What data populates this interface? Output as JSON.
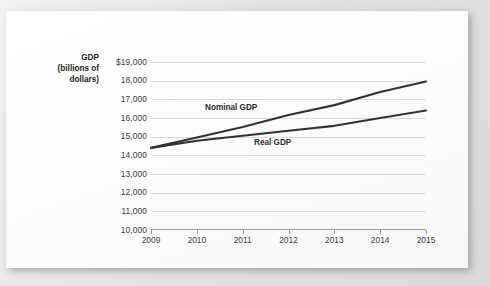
{
  "chart_data": {
    "type": "line",
    "title": "",
    "xlabel": "",
    "ylabel": "GDP (billions of dollars)",
    "ylabel_line1": "GDP",
    "ylabel_line2": "(billions of",
    "ylabel_line3": "dollars)",
    "x": [
      2009,
      2010,
      2011,
      2012,
      2013,
      2014,
      2015
    ],
    "categories": [
      "2009",
      "2010",
      "2011",
      "2012",
      "2013",
      "2014",
      "2015"
    ],
    "ylim": [
      10000,
      19000
    ],
    "ytick_step": 1000,
    "yticks": [
      19000,
      18000,
      17000,
      16000,
      15000,
      14000,
      13000,
      12000,
      11000,
      10000
    ],
    "ytick_labels": [
      "$19,000",
      "18,000",
      "17,000",
      "16,000",
      "15,000",
      "14,000",
      "13,000",
      "12,000",
      "11,000",
      "10,000"
    ],
    "grid": true,
    "legend": "inline-annotations",
    "series": [
      {
        "name": "Nominal GDP",
        "values": [
          14400,
          14960,
          15520,
          16160,
          16690,
          17390,
          17950
        ],
        "color": "#333333"
      },
      {
        "name": "Real GDP",
        "values": [
          14400,
          14780,
          15050,
          15320,
          15580,
          16000,
          16400
        ],
        "color": "#333333"
      }
    ],
    "annotations": [
      {
        "text": "Nominal GDP"
      },
      {
        "text": "Real GDP"
      }
    ]
  },
  "colors": {
    "page_background": "#e3e4e5",
    "card_background": "#fdfdfd",
    "gridline": "#dcdcdc",
    "axis": "#9a9a9a",
    "line": "#333333",
    "text": "#3a3a3a"
  }
}
